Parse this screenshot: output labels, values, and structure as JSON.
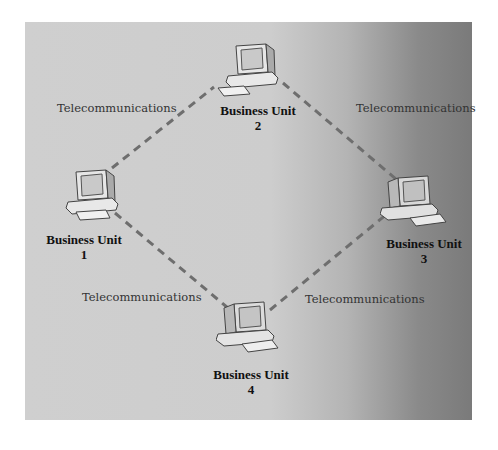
{
  "diagram": {
    "type": "network",
    "nodes": [
      {
        "id": "unit-1",
        "label": "Business Unit",
        "number": "1"
      },
      {
        "id": "unit-2",
        "label": "Business Unit",
        "number": "2"
      },
      {
        "id": "unit-3",
        "label": "Business Unit",
        "number": "3"
      },
      {
        "id": "unit-4",
        "label": "Business Unit",
        "number": "4"
      }
    ],
    "links": [
      {
        "from": "unit-1",
        "to": "unit-2",
        "label": "Telecommunications"
      },
      {
        "from": "unit-2",
        "to": "unit-3",
        "label": "Telecommunications"
      },
      {
        "from": "unit-1",
        "to": "unit-4",
        "label": "Telecommunications"
      },
      {
        "from": "unit-4",
        "to": "unit-3",
        "label": "Telecommunications"
      }
    ],
    "link_color": "#6e6e6e"
  }
}
